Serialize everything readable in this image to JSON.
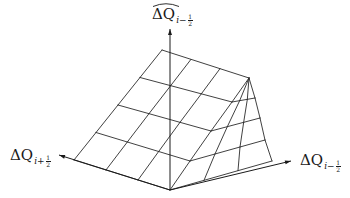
{
  "diagram": {
    "type": "3d-surface-wireframe",
    "stroke_color": "#2b2b2b",
    "background": "#ffffff",
    "axes": {
      "vertical": {
        "label_main": "ΔQ",
        "label_hat": true,
        "label_sub_sign": "i−",
        "label_sub_num": "1",
        "label_sub_den": "2",
        "from": [
          170,
          190
        ],
        "to": [
          170,
          29
        ]
      },
      "left": {
        "label_main": "ΔQ",
        "label_sub_sign": "i+",
        "label_sub_num": "1",
        "label_sub_den": "2",
        "from": [
          170,
          190
        ],
        "to": [
          59,
          155
        ]
      },
      "right": {
        "label_main": "ΔQ",
        "label_sub_sign": "i−",
        "label_sub_num": "1",
        "label_sub_den": "2",
        "from": [
          170,
          190
        ],
        "to": [
          291,
          161
        ]
      }
    },
    "surface": {
      "left_face": {
        "rows": 4,
        "cols": 3,
        "corners": {
          "top_left": [
            162,
            50
          ],
          "top_right": [
            249,
            78
          ],
          "bottom_left": [
            74,
            160
          ],
          "bottom_right": [
            170,
            190
          ]
        }
      },
      "fold_line": [
        [
          170,
          190
        ],
        [
          190,
          161
        ],
        [
          211,
          131
        ],
        [
          232,
          102
        ],
        [
          249,
          78
        ]
      ],
      "right_face": {
        "rows": 4,
        "cols": 3,
        "right_edge": [
          [
            249,
            78
          ],
          [
            255,
            98
          ],
          [
            260,
            118
          ],
          [
            265,
            140
          ],
          [
            272,
            161
          ]
        ]
      }
    }
  }
}
